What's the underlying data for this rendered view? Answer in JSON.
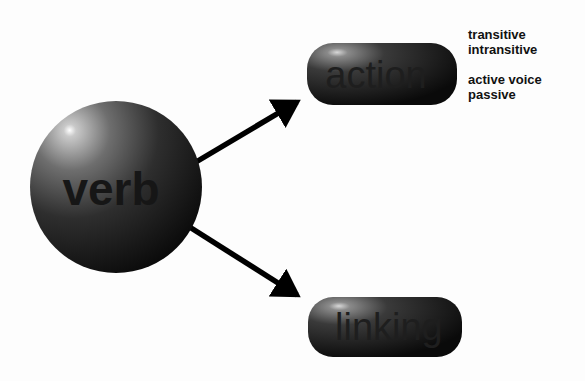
{
  "diagram": {
    "root": {
      "label": "verb"
    },
    "branches": [
      {
        "label": "action",
        "notes": [
          [
            "transitive",
            "intransitive"
          ],
          [
            "active voice",
            "passive"
          ]
        ]
      },
      {
        "label": "linking"
      }
    ]
  }
}
